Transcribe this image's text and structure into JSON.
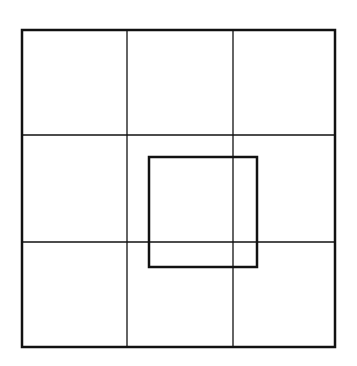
{
  "diagram": {
    "width": 357,
    "height": 366,
    "background": "#ffffff",
    "stroke_color": "#111111",
    "outer_square": {
      "x1": 22,
      "y1": 30,
      "x2": 335,
      "y2": 347,
      "stroke_width": 2.5
    },
    "grid": {
      "rows": 3,
      "cols": 3,
      "vertical_lines_x": [
        127,
        233
      ],
      "horizontal_lines_y": [
        135,
        242
      ],
      "stroke_width": 1.3
    },
    "inner_square": {
      "x1": 149,
      "y1": 157,
      "x2": 257,
      "y2": 267,
      "stroke_width": 2.5
    }
  }
}
